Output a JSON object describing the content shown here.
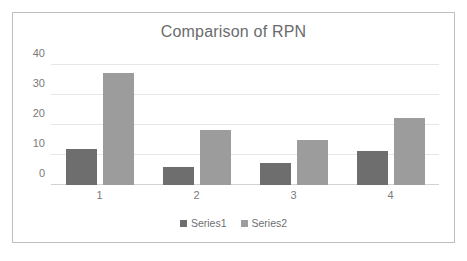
{
  "chart_data": {
    "type": "bar",
    "title": "Comparison of RPN",
    "xlabel": "",
    "ylabel": "",
    "categories": [
      "1",
      "2",
      "3",
      "4"
    ],
    "series": [
      {
        "name": "Series1",
        "color": "#6e6e6e",
        "values": [
          12,
          6,
          7.5,
          11.5
        ]
      },
      {
        "name": "Series2",
        "color": "#9c9c9c",
        "values": [
          37.5,
          18.5,
          15,
          22.5
        ]
      }
    ],
    "ylim": [
      0,
      40
    ],
    "yticks": [
      "0",
      "10",
      "20",
      "30",
      "40"
    ],
    "ytick_values": [
      0,
      10,
      20,
      30,
      40
    ],
    "grid": true,
    "legend_position": "bottom",
    "legend": [
      "Series1",
      "Series2"
    ]
  }
}
